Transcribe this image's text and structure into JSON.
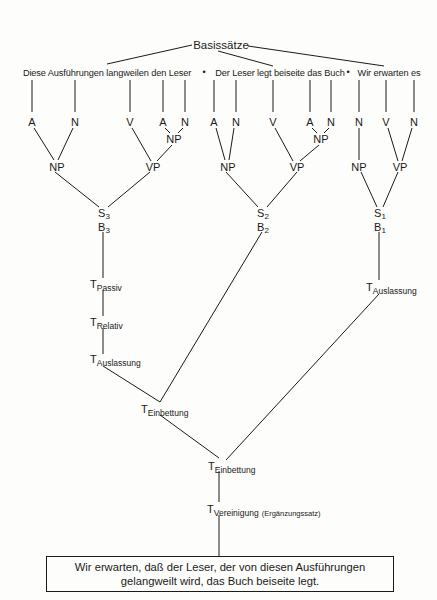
{
  "diagram": {
    "root_label": "Basissätze",
    "base_sentences": [
      {
        "text": "Diese Ausführungen langweilen den Leser"
      },
      {
        "text": "Der Leser legt beiseite das Buch"
      },
      {
        "text": "Wir erwarten es"
      }
    ],
    "separator_glyph": "•",
    "leaves": [
      "A",
      "N",
      "V",
      "A",
      "N",
      "A",
      "N",
      "V",
      "A",
      "N",
      "N",
      "V",
      "N"
    ],
    "phrases": {
      "np1": "NP",
      "vp1_np": "NP",
      "vp1": "VP",
      "np2": "NP",
      "vp2_np": "NP",
      "vp2": "VP",
      "np3": "NP",
      "vp3": "VP"
    },
    "sentence_nodes": [
      {
        "s": "S",
        "s_sub": "3",
        "b": "B",
        "b_sub": "3"
      },
      {
        "s": "S",
        "s_sub": "2",
        "b": "B",
        "b_sub": "2"
      },
      {
        "s": "S",
        "s_sub": "1",
        "b": "B",
        "b_sub": "1"
      }
    ],
    "transformations": {
      "passiv": {
        "t": "T",
        "sub": "Passiv"
      },
      "relativ": {
        "t": "T",
        "sub": "Relativ"
      },
      "auslassung_left": {
        "t": "T",
        "sub": "Auslassung"
      },
      "auslassung_right": {
        "t": "T",
        "sub": "Auslassung"
      },
      "einbettung_1": {
        "t": "T",
        "sub": "Einbettung"
      },
      "einbettung_2": {
        "t": "T",
        "sub": "Einbettung"
      },
      "vereinigung": {
        "t": "T",
        "sub": "Vereinigung",
        "note": "(Ergänzungssatz)"
      }
    },
    "result": {
      "line1": "Wir erwarten, daß der Leser, der von diesen Ausführungen",
      "line2": "gelangweilt wird, das Buch beiseite legt."
    },
    "colors": {
      "ink": "#1a1a1a",
      "paper": "#fdfdfb"
    }
  }
}
